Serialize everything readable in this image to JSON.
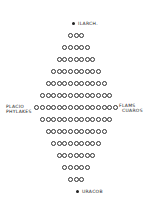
{
  "diagram": {
    "type": "diamond dot array",
    "top_label": "ILARCH.",
    "bottom_label": "URACOB",
    "left_label_line1": "PLACIO",
    "left_label_line2": "PHYLAKES",
    "right_label_line1": "FLAMS",
    "right_label_line2": "CUAROS",
    "row_counts": [
      3,
      5,
      7,
      9,
      11,
      13,
      15,
      13,
      11,
      9,
      7,
      5,
      3
    ],
    "colors": {
      "ink": "#222222",
      "background": "#ffffff"
    }
  }
}
